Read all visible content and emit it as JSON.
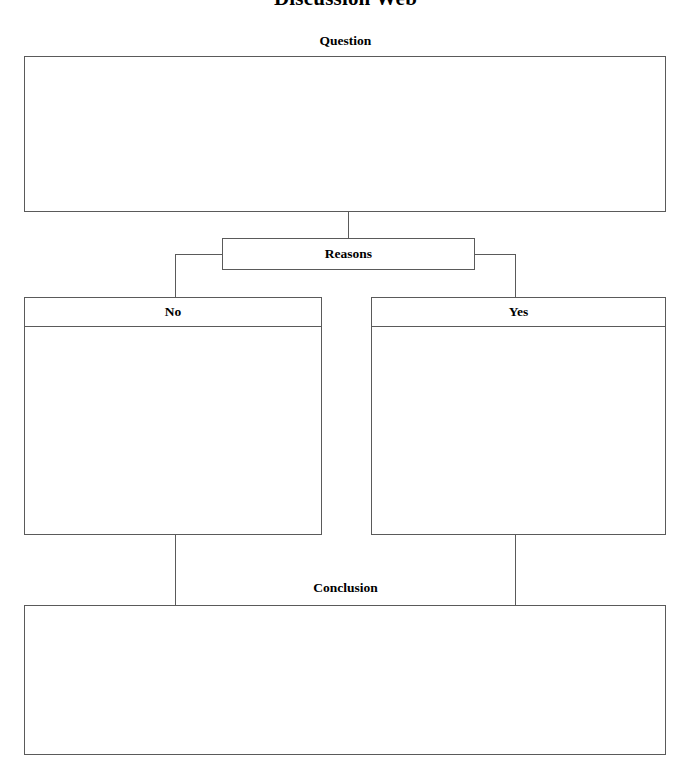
{
  "document": {
    "title": "Discussion Web"
  },
  "sections": {
    "question": {
      "caption": "Question",
      "content": ""
    },
    "reasons": {
      "caption": "Reasons"
    },
    "no": {
      "caption": "No",
      "content": ""
    },
    "yes": {
      "caption": "Yes",
      "content": ""
    },
    "conclusion": {
      "caption": "Conclusion",
      "content": ""
    }
  },
  "style": {
    "line_color": "#5a5a5a",
    "text_color": "#000000",
    "background": "#ffffff"
  }
}
